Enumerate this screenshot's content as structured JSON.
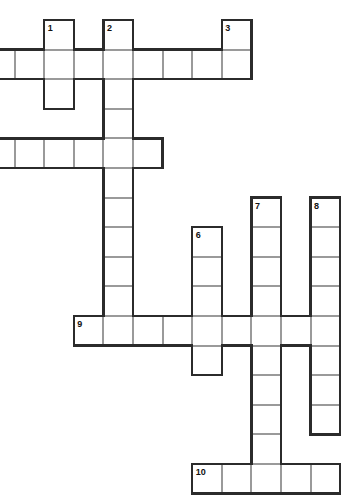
{
  "puzzle": {
    "title": "crossword-grid",
    "cell_size": 29.6,
    "origin_x": -15,
    "origin_y": 20,
    "grid_color": "#9a9a9a",
    "edge_color": "#2b2b2b",
    "cell_fill": "#ffffff",
    "background": "#ffffff",
    "numbers": [
      {
        "label": "1",
        "col": 2,
        "row": 0
      },
      {
        "label": "2",
        "col": 4,
        "row": 0
      },
      {
        "label": "3",
        "col": 8,
        "row": 0
      },
      {
        "label": "6",
        "col": 7,
        "row": 7
      },
      {
        "label": "7",
        "col": 9,
        "row": 6
      },
      {
        "label": "8",
        "col": 11,
        "row": 6
      },
      {
        "label": "9",
        "col": 3,
        "row": 10
      },
      {
        "label": "10",
        "col": 7,
        "row": 15
      }
    ],
    "entries": [
      {
        "name": "across-1",
        "dir": "across",
        "col": -1,
        "row": 1,
        "length": 10
      },
      {
        "name": "across-2",
        "dir": "across",
        "col": -1,
        "row": 4,
        "length": 7
      },
      {
        "name": "across-9",
        "dir": "across",
        "col": 3,
        "row": 10,
        "length": 9
      },
      {
        "name": "across-10",
        "dir": "across",
        "col": 7,
        "row": 15,
        "length": 5
      },
      {
        "name": "down-1",
        "dir": "down",
        "col": 2,
        "row": 0,
        "length": 3
      },
      {
        "name": "down-2",
        "dir": "down",
        "col": 4,
        "row": 0,
        "length": 11
      },
      {
        "name": "down-3",
        "dir": "down",
        "col": 8,
        "row": 0,
        "length": 2
      },
      {
        "name": "down-6",
        "dir": "down",
        "col": 7,
        "row": 7,
        "length": 5
      },
      {
        "name": "down-7",
        "dir": "down",
        "col": 9,
        "row": 6,
        "length": 10
      },
      {
        "name": "down-8",
        "dir": "down",
        "col": 11,
        "row": 6,
        "length": 8
      }
    ]
  }
}
